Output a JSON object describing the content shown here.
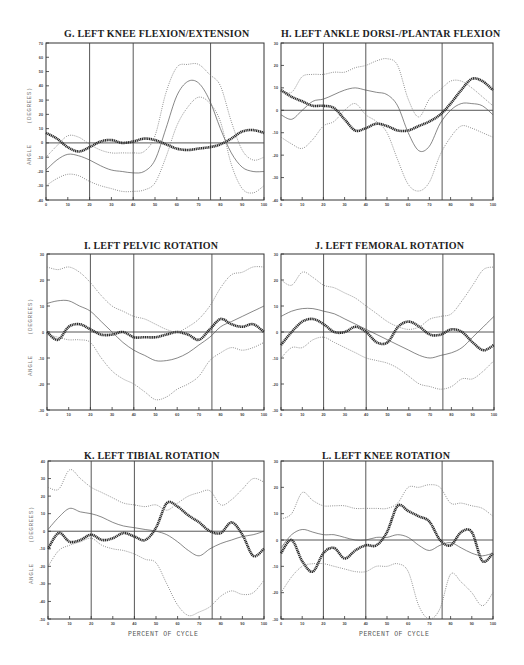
{
  "xaxis_label": "PERCENT OF CYCLE",
  "yaxis_label": "ANGLE     (DEGREES)",
  "chart_data": [
    {
      "id": "G",
      "type": "line",
      "title": "G.  LEFT KNEE FLEXION/EXTENSION",
      "xlabel": "",
      "ylabel": "ANGLE (DEGREES)",
      "xlim": [
        0,
        100
      ],
      "ylim": [
        -40,
        70
      ],
      "xticks": [
        0,
        10,
        20,
        30,
        40,
        50,
        60,
        70,
        80,
        90,
        100
      ],
      "yticks": [
        -40,
        -30,
        -20,
        -10,
        0,
        10,
        20,
        30,
        40,
        50,
        60,
        70
      ],
      "vlines": [
        20,
        40,
        75.5
      ],
      "frame": [
        46,
        43,
        264,
        200
      ],
      "title_pos": [
        64,
        28
      ],
      "show_ylabel": true,
      "show_xlabel": false,
      "x": [
        0,
        5,
        10,
        15,
        20,
        25,
        30,
        35,
        40,
        45,
        50,
        55,
        60,
        65,
        70,
        75,
        80,
        85,
        90,
        95,
        100
      ],
      "series": [
        {
          "name": "patient",
          "style": "thick",
          "values": [
            7,
            3,
            -3,
            -6,
            -3,
            1,
            2,
            0,
            1,
            3,
            2,
            -1,
            -4,
            -5,
            -4,
            -3,
            -1,
            3,
            8,
            9,
            7
          ]
        },
        {
          "name": "normal mean",
          "style": "solid",
          "values": [
            -19,
            -12,
            -8,
            -9,
            -12,
            -16,
            -19,
            -20,
            -21,
            -20,
            -12,
            10,
            33,
            43,
            42,
            30,
            10,
            -7,
            -17,
            -20,
            -20
          ]
        },
        {
          "name": "normal +1SD",
          "style": "dotted",
          "values": [
            -10,
            -2,
            5,
            4,
            -1,
            -5,
            -7,
            -7,
            -7,
            -6,
            5,
            35,
            53,
            55,
            55,
            48,
            40,
            15,
            -5,
            -12,
            -10
          ]
        },
        {
          "name": "normal -1SD",
          "style": "dotted",
          "values": [
            -30,
            -25,
            -22,
            -23,
            -27,
            -30,
            -32,
            -34,
            -34,
            -33,
            -28,
            -10,
            12,
            25,
            32,
            28,
            15,
            -15,
            -32,
            -35,
            -30
          ]
        }
      ]
    },
    {
      "id": "H",
      "type": "line",
      "title": "H.  LEFT ANKLE DORSI-/PLANTAR FLEXION",
      "xlabel": "",
      "ylabel": "",
      "xlim": [
        0,
        100
      ],
      "ylim": [
        -40,
        30
      ],
      "xticks": [
        0,
        10,
        20,
        30,
        40,
        50,
        60,
        70,
        80,
        90,
        100
      ],
      "yticks": [
        -40,
        -30,
        -20,
        -10,
        0,
        10,
        20,
        30
      ],
      "vlines": [
        20,
        40,
        76
      ],
      "frame": [
        281,
        43,
        493,
        200
      ],
      "title_pos": [
        281,
        28
      ],
      "show_ylabel": false,
      "show_xlabel": false,
      "x": [
        0,
        5,
        10,
        15,
        20,
        25,
        30,
        35,
        40,
        45,
        50,
        55,
        60,
        65,
        70,
        75,
        80,
        85,
        90,
        95,
        100
      ],
      "series": [
        {
          "name": "patient",
          "style": "thick",
          "values": [
            9,
            6,
            4,
            2,
            2,
            1,
            -4,
            -9,
            -8,
            -6,
            -7,
            -9,
            -9,
            -7,
            -5,
            -2,
            3,
            9,
            14,
            13,
            9
          ]
        },
        {
          "name": "normal mean",
          "style": "solid",
          "values": [
            -2,
            -4,
            0,
            4,
            5,
            7,
            9,
            10,
            9,
            8,
            7,
            2,
            -10,
            -18,
            -16,
            -6,
            0,
            3,
            3,
            2,
            -2
          ]
        },
        {
          "name": "normal +1SD",
          "style": "dotted",
          "values": [
            9,
            8,
            15,
            16,
            16,
            17,
            17,
            19,
            20,
            22,
            23,
            20,
            5,
            -3,
            5,
            9,
            13,
            13,
            10,
            6,
            2
          ]
        },
        {
          "name": "normal -1SD",
          "style": "dotted",
          "values": [
            -12,
            -15,
            -17,
            -13,
            -7,
            -5,
            0,
            3,
            -2,
            -5,
            -10,
            -22,
            -33,
            -36,
            -32,
            -20,
            -12,
            -7,
            -8,
            -10,
            -12
          ]
        }
      ]
    },
    {
      "id": "I",
      "type": "line",
      "title": "I.    LEFT PELVIC ROTATION",
      "xlabel": "",
      "ylabel": "ANGLE (DEGREES)",
      "xlim": [
        0,
        100
      ],
      "ylim": [
        -30,
        30
      ],
      "xticks": [
        0,
        10,
        20,
        30,
        40,
        50,
        60,
        70,
        80,
        90,
        100
      ],
      "yticks": [
        -30,
        -20,
        -10,
        0,
        10,
        20,
        30
      ],
      "vlines": [
        20,
        40,
        76
      ],
      "frame": [
        47,
        254,
        264,
        410
      ],
      "title_pos": [
        84,
        240
      ],
      "show_ylabel": true,
      "show_xlabel": false,
      "x": [
        0,
        5,
        10,
        15,
        20,
        25,
        30,
        35,
        40,
        45,
        50,
        55,
        60,
        65,
        70,
        75,
        80,
        85,
        90,
        95,
        100
      ],
      "series": [
        {
          "name": "patient",
          "style": "thick",
          "values": [
            0,
            -3,
            2,
            3,
            1,
            -1,
            -1,
            0,
            -2,
            -2,
            -2,
            -1,
            0,
            -1,
            -3,
            1,
            5,
            3,
            2,
            3,
            0
          ]
        },
        {
          "name": "normal mean",
          "style": "solid",
          "values": [
            11,
            12,
            12,
            10,
            8,
            4,
            0,
            -4,
            -7,
            -9,
            -11,
            -11,
            -10,
            -8,
            -5,
            -2,
            2,
            4,
            6,
            8,
            10
          ]
        },
        {
          "name": "normal +1SD",
          "style": "dotted",
          "values": [
            25,
            24,
            25,
            23,
            19,
            14,
            10,
            8,
            6,
            5,
            3,
            1,
            0,
            2,
            5,
            10,
            17,
            22,
            23,
            25,
            25
          ]
        },
        {
          "name": "normal -1SD",
          "style": "dotted",
          "values": [
            -1,
            -2,
            -3,
            -3,
            -4,
            -10,
            -15,
            -18,
            -20,
            -23,
            -26,
            -25,
            -22,
            -20,
            -17,
            -11,
            -8,
            -6,
            -7,
            -6,
            -4
          ]
        }
      ]
    },
    {
      "id": "J",
      "type": "line",
      "title": "J.   LEFT FEMORAL ROTATION",
      "xlabel": "",
      "ylabel": "",
      "xlim": [
        0,
        100
      ],
      "ylim": [
        -30,
        30
      ],
      "xticks": [
        0,
        10,
        20,
        30,
        40,
        50,
        60,
        70,
        80,
        90,
        100
      ],
      "yticks": [
        -30,
        -20,
        -10,
        0,
        10,
        20,
        30
      ],
      "vlines": [
        20,
        40,
        76
      ],
      "frame": [
        281,
        254,
        494,
        410
      ],
      "title_pos": [
        315,
        240
      ],
      "show_ylabel": false,
      "show_xlabel": false,
      "x": [
        0,
        5,
        10,
        15,
        20,
        25,
        30,
        35,
        40,
        45,
        50,
        55,
        60,
        65,
        70,
        75,
        80,
        85,
        90,
        95,
        100
      ],
      "series": [
        {
          "name": "patient",
          "style": "thick",
          "values": [
            -5,
            0,
            4,
            5,
            3,
            0,
            0,
            2,
            0,
            -4,
            -4,
            2,
            4,
            2,
            -1,
            -1,
            1,
            0,
            -4,
            -7,
            -5
          ]
        },
        {
          "name": "normal mean",
          "style": "solid",
          "values": [
            6,
            8,
            9,
            9,
            8,
            7,
            5,
            3,
            1,
            -1,
            -3,
            -5,
            -7,
            -9,
            -10,
            -9,
            -8,
            -6,
            -2,
            2,
            6
          ]
        },
        {
          "name": "normal +1SD",
          "style": "dotted",
          "values": [
            20,
            18,
            23,
            21,
            18,
            17,
            15,
            13,
            10,
            7,
            4,
            2,
            1,
            2,
            5,
            6,
            7,
            12,
            18,
            24,
            25
          ]
        },
        {
          "name": "normal -1SD",
          "style": "dotted",
          "values": [
            -10,
            -6,
            -6,
            -3,
            -2,
            -4,
            -6,
            -8,
            -10,
            -11,
            -12,
            -14,
            -17,
            -20,
            -21,
            -22,
            -21,
            -18,
            -18,
            -15,
            -11
          ]
        }
      ]
    },
    {
      "id": "K",
      "type": "line",
      "title": "K.  LEFT TIBIAL ROTATION",
      "xlabel": "PERCENT OF CYCLE",
      "ylabel": "ANGLE (DEGREES)",
      "xlim": [
        0,
        100
      ],
      "ylim": [
        -50,
        40
      ],
      "xticks": [
        0,
        10,
        20,
        30,
        40,
        50,
        60,
        70,
        80,
        90,
        100
      ],
      "yticks": [
        -50,
        -40,
        -30,
        -20,
        -10,
        0,
        10,
        20,
        30,
        40
      ],
      "vlines": [
        20,
        40,
        76
      ],
      "frame": [
        48,
        461,
        264,
        619
      ],
      "title_pos": [
        84,
        450
      ],
      "show_ylabel": true,
      "show_xlabel": true,
      "x": [
        0,
        5,
        10,
        15,
        20,
        25,
        30,
        35,
        40,
        45,
        50,
        55,
        60,
        65,
        70,
        75,
        80,
        85,
        90,
        95,
        100
      ],
      "series": [
        {
          "name": "patient",
          "style": "thick",
          "values": [
            -10,
            -1,
            -6,
            -5,
            -2,
            -5,
            -4,
            -1,
            -3,
            -5,
            2,
            16,
            14,
            9,
            5,
            0,
            -1,
            5,
            -2,
            -14,
            -10
          ]
        },
        {
          "name": "normal mean",
          "style": "solid",
          "values": [
            1,
            8,
            13,
            11,
            10,
            8,
            5,
            3,
            2,
            1,
            0,
            -2,
            -6,
            -11,
            -14,
            -10,
            -7,
            -5,
            -3,
            -2,
            0
          ]
        },
        {
          "name": "normal +1SD",
          "style": "dotted",
          "values": [
            25,
            24,
            35,
            30,
            25,
            22,
            19,
            16,
            15,
            14,
            15,
            12,
            16,
            20,
            22,
            23,
            15,
            18,
            24,
            30,
            28
          ]
        },
        {
          "name": "normal -1SD",
          "style": "dotted",
          "values": [
            -20,
            -11,
            -8,
            -6,
            -4,
            -8,
            -10,
            -11,
            -13,
            -16,
            -18,
            -30,
            -42,
            -48,
            -46,
            -43,
            -37,
            -34,
            -36,
            -35,
            -28
          ]
        }
      ]
    },
    {
      "id": "L",
      "type": "line",
      "title": "L.   LEFT KNEE ROTATION",
      "xlabel": "PERCENT OF CYCLE",
      "ylabel": "",
      "xlim": [
        0,
        100
      ],
      "ylim": [
        -30,
        30
      ],
      "xticks": [
        0,
        10,
        20,
        30,
        40,
        50,
        60,
        70,
        80,
        90,
        100
      ],
      "yticks": [
        -30,
        -20,
        -10,
        0,
        10,
        20,
        30
      ],
      "vlines": [
        20,
        40,
        76
      ],
      "frame": [
        281,
        461,
        493,
        619
      ],
      "title_pos": [
        322,
        450
      ],
      "show_ylabel": false,
      "show_xlabel": true,
      "x": [
        0,
        5,
        10,
        15,
        20,
        25,
        30,
        35,
        40,
        45,
        50,
        55,
        60,
        65,
        70,
        75,
        80,
        85,
        90,
        95,
        100
      ],
      "series": [
        {
          "name": "patient",
          "style": "thick",
          "values": [
            -5,
            0,
            -8,
            -12,
            -5,
            -3,
            -7,
            -4,
            -2,
            -2,
            3,
            13,
            11,
            9,
            7,
            0,
            -2,
            3,
            3,
            -8,
            -5
          ]
        },
        {
          "name": "normal mean",
          "style": "solid",
          "values": [
            -3,
            2,
            4,
            3,
            2,
            2,
            1,
            0,
            0,
            1,
            1,
            2,
            1,
            -2,
            -4,
            -2,
            -1,
            -3,
            -5,
            -6,
            -5
          ]
        },
        {
          "name": "normal +1SD",
          "style": "dotted",
          "values": [
            8,
            10,
            18,
            15,
            13,
            13,
            13,
            12,
            12,
            12,
            12,
            14,
            20,
            20,
            21,
            20,
            14,
            14,
            13,
            12,
            9
          ]
        },
        {
          "name": "normal -1SD",
          "style": "dotted",
          "values": [
            -20,
            -14,
            -10,
            -9,
            -9,
            -10,
            -11,
            -12,
            -12,
            -10,
            -10,
            -9,
            -12,
            -25,
            -30,
            -26,
            -13,
            -16,
            -20,
            -25,
            -20
          ]
        }
      ]
    }
  ]
}
